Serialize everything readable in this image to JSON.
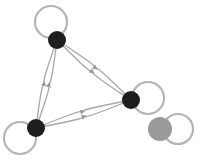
{
  "diagram": {
    "type": "directed-graph",
    "colors": {
      "node": "#1e1e1e",
      "node_alt": "#9a9a9a",
      "edge": "#a8a8a8",
      "loop": "#b4b4b4",
      "background": "#ffffff"
    },
    "nodes": [
      {
        "id": "A",
        "x": 57,
        "y": 40,
        "r": 9,
        "fill": "#1e1e1e"
      },
      {
        "id": "B",
        "x": 131,
        "y": 100,
        "r": 9,
        "fill": "#1e1e1e"
      },
      {
        "id": "C",
        "x": 36,
        "y": 128,
        "r": 9,
        "fill": "#1e1e1e"
      },
      {
        "id": "D",
        "x": 160,
        "y": 129,
        "r": 12,
        "fill": "#9a9a9a"
      }
    ],
    "self_loops": [
      {
        "node": "A",
        "cx": 51,
        "cy": 22,
        "r": 16
      },
      {
        "node": "B",
        "cx": 148,
        "cy": 98,
        "r": 16
      },
      {
        "node": "C",
        "cx": 20,
        "cy": 138,
        "r": 16
      },
      {
        "node": "D",
        "cx": 178,
        "cy": 129,
        "r": 15
      }
    ],
    "edges": [
      {
        "from": "A",
        "to": "B"
      },
      {
        "from": "B",
        "to": "A"
      },
      {
        "from": "A",
        "to": "C"
      },
      {
        "from": "C",
        "to": "A"
      },
      {
        "from": "B",
        "to": "C"
      },
      {
        "from": "C",
        "to": "B"
      }
    ]
  }
}
